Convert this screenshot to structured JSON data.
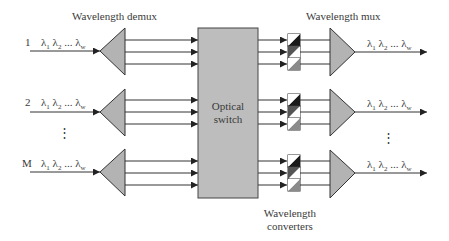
{
  "diagram": {
    "title_demux": "Wavelength demux",
    "title_mux": "Wavelength mux",
    "switch_label_line1": "Optical",
    "switch_label_line2": "switch",
    "converters_label_line1": "Wavelength",
    "converters_label_line2": "converters",
    "ellipsis": "⋮",
    "inputs": [
      {
        "port": "1",
        "lambda_1": "λ",
        "sub_1": "1",
        "lambda_2": "λ",
        "sub_2": "2",
        "dots": "...",
        "lambda_w": "λ",
        "sub_w": "w"
      },
      {
        "port": "2",
        "lambda_1": "λ",
        "sub_1": "1",
        "lambda_2": "λ",
        "sub_2": "2",
        "dots": "...",
        "lambda_w": "λ",
        "sub_w": "w"
      },
      {
        "port": "M",
        "lambda_1": "λ",
        "sub_1": "1",
        "lambda_2": "λ",
        "sub_2": "2",
        "dots": "...",
        "lambda_w": "λ",
        "sub_w": "w"
      }
    ],
    "outputs": [
      {
        "lambda_1": "λ",
        "sub_1": "1",
        "lambda_2": "λ",
        "sub_2": "2",
        "dots": "...",
        "lambda_w": "λ",
        "sub_w": "w"
      },
      {
        "lambda_1": "λ",
        "sub_1": "1",
        "lambda_2": "λ",
        "sub_2": "2",
        "dots": "...",
        "lambda_w": "λ",
        "sub_w": "w"
      },
      {
        "lambda_1": "λ",
        "sub_1": "1",
        "lambda_2": "λ",
        "sub_2": "2",
        "dots": "...",
        "lambda_w": "λ",
        "sub_w": "w"
      }
    ],
    "colors": {
      "line": "#333333",
      "triangle_fill": "#b3b3b3",
      "switch_fill": "#bdbdbd",
      "converter_dark": "#1a1a1a",
      "converter_mid": "#555555",
      "converter_light": "#8a8a8a",
      "converter_white": "#ffffff"
    }
  }
}
